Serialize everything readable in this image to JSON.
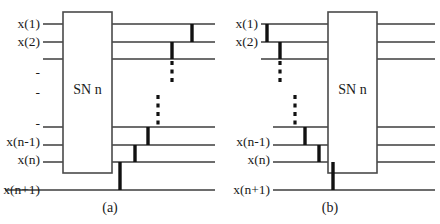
{
  "figure": {
    "width": 440,
    "height": 224,
    "background": "#ffffff",
    "line_color": "#3c3c3c",
    "bar_color": "#111111",
    "box_fill": "#ffffff",
    "box_stroke": "#4a4a4a"
  },
  "panels": [
    {
      "id": "a",
      "caption": "(a)",
      "caption_x": 110,
      "caption_y": 208,
      "box": {
        "label": "SN n",
        "x": 63,
        "y": 12,
        "width": 49,
        "height": 161,
        "label_x": 87.5,
        "label_y": 90
      },
      "input_labels": [
        {
          "text": "x(1)",
          "x": 40,
          "y": 24
        },
        {
          "text": "x(2)",
          "x": 40,
          "y": 42
        },
        {
          "text": "x(n-1)",
          "x": 40,
          "y": 142
        },
        {
          "text": "x(n)",
          "x": 40,
          "y": 160
        },
        {
          "text": "x(n+1)",
          "x": 40,
          "y": 190
        }
      ],
      "ellipsis_marks": [
        {
          "text": "-",
          "x": 40,
          "y": 73
        },
        {
          "text": "-",
          "x": 40,
          "y": 93
        },
        {
          "text": "-",
          "x": 40,
          "y": 124
        }
      ],
      "input_wires": [
        {
          "x1": 43,
          "x2": 63,
          "y": 24
        },
        {
          "x1": 43,
          "x2": 63,
          "y": 42
        },
        {
          "x1": 43,
          "x2": 63,
          "y": 59
        },
        {
          "x1": 43,
          "x2": 63,
          "y": 127
        },
        {
          "x1": 43,
          "x2": 63,
          "y": 145
        },
        {
          "x1": 43,
          "x2": 63,
          "y": 162
        }
      ],
      "bottom_wire": {
        "x1": 5,
        "x2": 215,
        "y": 190
      },
      "output_wires": [
        {
          "x1": 112,
          "x2": 215,
          "y": 24
        },
        {
          "x1": 112,
          "x2": 215,
          "y": 42
        },
        {
          "x1": 112,
          "x2": 215,
          "y": 59
        },
        {
          "x1": 112,
          "x2": 215,
          "y": 127
        },
        {
          "x1": 112,
          "x2": 215,
          "y": 145
        },
        {
          "x1": 112,
          "x2": 215,
          "y": 162
        }
      ],
      "comparator_bars": [
        {
          "x": 192,
          "y1": 24,
          "y2": 42
        },
        {
          "x": 172,
          "y1": 42,
          "y2": 59
        },
        {
          "x": 148,
          "y1": 127,
          "y2": 145
        },
        {
          "x": 135,
          "y1": 145,
          "y2": 162
        },
        {
          "x": 120,
          "y1": 162,
          "y2": 190
        }
      ],
      "dashed_bars": [
        {
          "x": 172,
          "y1": 61,
          "y2": 84
        },
        {
          "x": 158,
          "y1": 95,
          "y2": 125
        }
      ]
    },
    {
      "id": "b",
      "caption": "(b)",
      "caption_x": 110,
      "caption_y": 208,
      "box": {
        "label": "SN n",
        "x": 108,
        "y": 12,
        "width": 49,
        "height": 161,
        "label_x": 132.5,
        "label_y": 90
      },
      "input_labels": [
        {
          "text": "x(1)",
          "x": 38,
          "y": 24
        },
        {
          "text": "x(2)",
          "x": 38,
          "y": 42
        },
        {
          "text": "x(n-1)",
          "x": 50,
          "y": 142
        },
        {
          "text": "x(n)",
          "x": 50,
          "y": 160
        },
        {
          "text": "x(n+1)",
          "x": 50,
          "y": 190
        }
      ],
      "ellipsis_marks": [],
      "input_wires": [
        {
          "x1": 41,
          "x2": 108,
          "y": 24
        },
        {
          "x1": 41,
          "x2": 108,
          "y": 42
        },
        {
          "x1": 41,
          "x2": 108,
          "y": 59
        },
        {
          "x1": 53,
          "x2": 108,
          "y": 127
        },
        {
          "x1": 53,
          "x2": 108,
          "y": 145
        },
        {
          "x1": 53,
          "x2": 108,
          "y": 162
        }
      ],
      "bottom_wire": {
        "x1": 53,
        "x2": 215,
        "y": 190
      },
      "output_wires": [
        {
          "x1": 157,
          "x2": 215,
          "y": 24
        },
        {
          "x1": 157,
          "x2": 215,
          "y": 42
        },
        {
          "x1": 157,
          "x2": 215,
          "y": 59
        },
        {
          "x1": 157,
          "x2": 215,
          "y": 127
        },
        {
          "x1": 157,
          "x2": 215,
          "y": 145
        },
        {
          "x1": 157,
          "x2": 215,
          "y": 162
        }
      ],
      "comparator_bars": [
        {
          "x": 47,
          "y1": 24,
          "y2": 42
        },
        {
          "x": 60,
          "y1": 42,
          "y2": 59
        },
        {
          "x": 85,
          "y1": 127,
          "y2": 145
        },
        {
          "x": 99,
          "y1": 145,
          "y2": 162
        },
        {
          "x": 113,
          "y1": 162,
          "y2": 190
        }
      ],
      "dashed_bars": [
        {
          "x": 60,
          "y1": 61,
          "y2": 84
        },
        {
          "x": 75,
          "y1": 95,
          "y2": 125
        }
      ]
    }
  ]
}
